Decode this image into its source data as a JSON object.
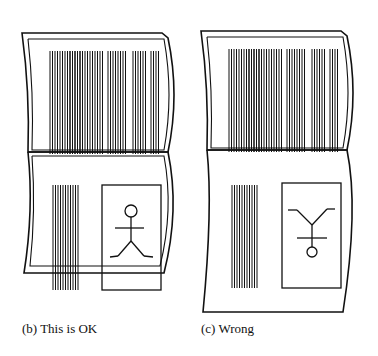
{
  "panels": [
    {
      "id": "b",
      "caption": "(b)  This is OK",
      "figure": "upright-stick-figure"
    },
    {
      "id": "c",
      "caption": "(c)  Wrong",
      "figure": "upside-down-stick-figure"
    }
  ],
  "colors": {
    "ink": "#111111",
    "paper": "#ffffff"
  }
}
